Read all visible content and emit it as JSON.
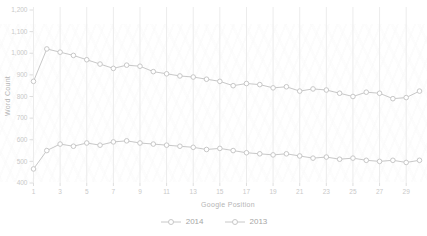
{
  "chart_data": {
    "type": "line",
    "title": "",
    "xlabel": "Google Position",
    "ylabel": "Word Count",
    "x": [
      1,
      2,
      3,
      4,
      5,
      6,
      7,
      8,
      9,
      10,
      11,
      12,
      13,
      14,
      15,
      16,
      17,
      18,
      19,
      20,
      21,
      22,
      23,
      24,
      25,
      26,
      27,
      28,
      29,
      30
    ],
    "x_tick_positions": [
      1,
      3,
      5,
      7,
      9,
      11,
      13,
      15,
      17,
      19,
      21,
      23,
      25,
      27,
      29
    ],
    "y_tick_values": [
      400,
      500,
      600,
      700,
      800,
      900,
      1000,
      1100,
      1200
    ],
    "y_tick_labels": [
      "400",
      "500",
      "600",
      "700",
      "800",
      "900",
      "1,000",
      "1,100",
      "1,200"
    ],
    "ylim": [
      400,
      1200
    ],
    "grid": "vertical",
    "legend_position": "bottom",
    "series": [
      {
        "name": "2014",
        "values": [
          870,
          1020,
          1005,
          990,
          970,
          950,
          930,
          945,
          940,
          915,
          905,
          895,
          890,
          880,
          870,
          850,
          860,
          855,
          840,
          845,
          825,
          835,
          830,
          815,
          800,
          820,
          815,
          790,
          795,
          825
        ]
      },
      {
        "name": "2013",
        "values": [
          465,
          550,
          580,
          570,
          585,
          575,
          590,
          595,
          585,
          580,
          575,
          570,
          565,
          555,
          560,
          550,
          540,
          535,
          530,
          535,
          525,
          515,
          520,
          510,
          515,
          505,
          500,
          505,
          495,
          505
        ]
      }
    ]
  },
  "colors": {
    "series_line": "#c8c8c8",
    "marker_fill": "#ffffff",
    "grid_line": "#ececec",
    "tick_line": "#dedede",
    "tick_text": "#c9c9c9",
    "axis_title_text": "#b5b5b5",
    "legend_text": "#a6a6a6",
    "background": "#ffffff"
  }
}
